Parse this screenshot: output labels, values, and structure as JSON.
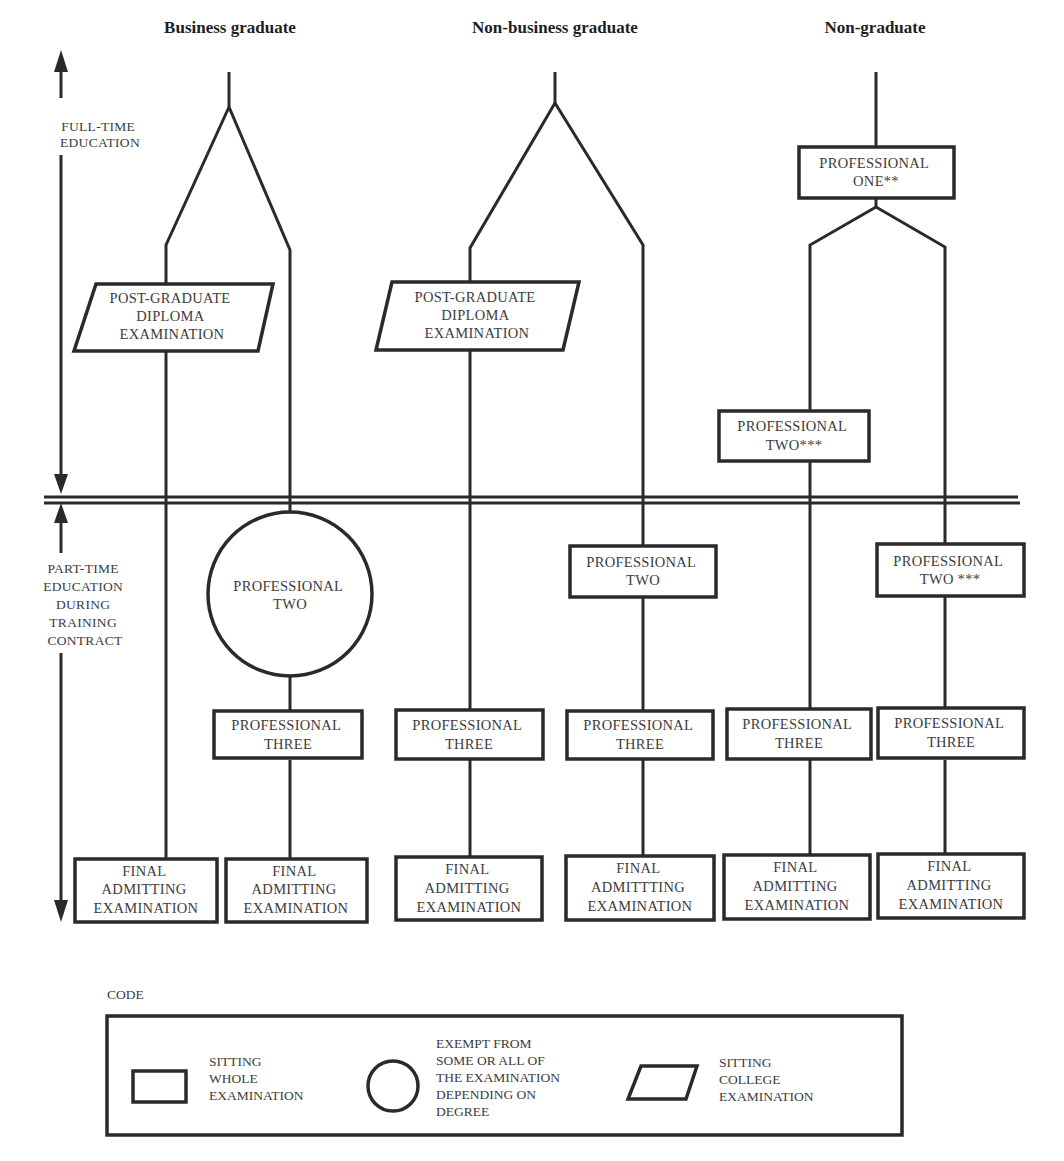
{
  "columns": [
    {
      "id": "business",
      "title": "Business graduate"
    },
    {
      "id": "non-business",
      "title": "Non-business graduate"
    },
    {
      "id": "non-graduate",
      "title": "Non-graduate"
    }
  ],
  "phases": {
    "full_time": [
      "FULL-TIME",
      "EDUCATION"
    ],
    "part_time": [
      "PART-TIME",
      "EDUCATION",
      "DURING",
      "TRAINING",
      "CONTRACT"
    ]
  },
  "nodes": {
    "bg_pgd": [
      "POST-GRADUATE",
      "DIPLOMA",
      "EXAMINATION"
    ],
    "bg_p2_circle": [
      "PROFESSIONAL",
      "TWO"
    ],
    "bg_p3": [
      "PROFESSIONAL",
      "THREE"
    ],
    "bg_fae_left": [
      "FINAL",
      "ADMITTING",
      "EXAMINATION"
    ],
    "bg_fae_right": [
      "FINAL",
      "ADMITTING",
      "EXAMINATION"
    ],
    "nbg_pgd": [
      "POST-GRADUATE",
      "DIPLOMA",
      "EXAMINATION"
    ],
    "nbg_p3_left": [
      "PROFESSIONAL",
      "THREE"
    ],
    "nbg_p2_right": [
      "PROFESSIONAL",
      "TWO"
    ],
    "nbg_p3_right": [
      "PROFESSIONAL",
      "THREE"
    ],
    "nbg_fae_left": [
      "FINAL",
      "ADMITTING",
      "EXAMINATION"
    ],
    "nbg_fae_right": [
      "FINAL",
      "ADMITTTING",
      "EXAMINATION"
    ],
    "ng_p1": [
      "PROFESSIONAL",
      "ONE**"
    ],
    "ng_p2_left": [
      "PROFESSIONAL",
      "TWO***"
    ],
    "ng_p2_right": [
      "PROFESSIONAL",
      "TWO ***"
    ],
    "ng_p3_left": [
      "PROFESSIONAL",
      "THREE"
    ],
    "ng_p3_right": [
      "PROFESSIONAL",
      "THREE"
    ],
    "ng_fae_left": [
      "FINAL",
      "ADMITTING",
      "EXAMINATION"
    ],
    "ng_fae_right": [
      "FINAL",
      "ADMITTING",
      "EXAMINATION"
    ]
  },
  "legend": {
    "title": "CODE",
    "items": [
      {
        "shape": "rectangle",
        "text": [
          "SITTING",
          "WHOLE",
          "EXAMINATION"
        ]
      },
      {
        "shape": "circle",
        "text": [
          "EXEMPT FROM",
          "SOME OR ALL OF",
          "THE EXAMINATION",
          "DEPENDING ON",
          "DEGREE"
        ]
      },
      {
        "shape": "parallelogram",
        "text": [
          "SITTING",
          "COLLEGE",
          "EXAMINATION"
        ]
      }
    ]
  },
  "colors": {
    "line": "#2a2a2a",
    "text": "#3c3c3c",
    "background": "#ffffff"
  }
}
